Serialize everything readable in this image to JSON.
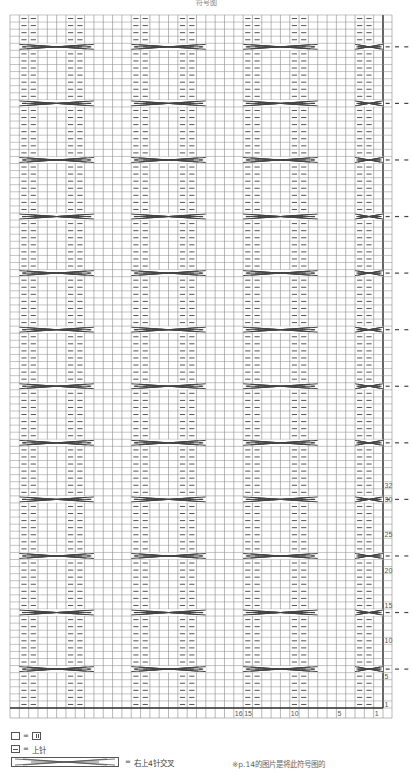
{
  "title": "符号图",
  "chart": {
    "columns": 40,
    "rows": 98,
    "repeat_pattern": [
      "k",
      "p",
      "p",
      "k",
      "k",
      "k",
      "p",
      "p",
      "k",
      "k",
      "k",
      "k"
    ],
    "cable_rows_from_top": [
      4,
      12,
      20,
      28,
      36,
      44,
      52,
      60,
      68,
      76,
      84,
      92
    ],
    "cable_repeat_start_cols": [
      1,
      13,
      25,
      37
    ],
    "row_numbers": [
      {
        "label": "32",
        "row_from_bottom": 32
      },
      {
        "label": "30",
        "row_from_bottom": 30
      },
      {
        "label": "25",
        "row_from_bottom": 25
      },
      {
        "label": "20",
        "row_from_bottom": 20
      },
      {
        "label": "15",
        "row_from_bottom": 15
      },
      {
        "label": "10",
        "row_from_bottom": 10
      },
      {
        "label": "5",
        "row_from_bottom": 5
      },
      {
        "label": "1",
        "row_from_bottom": 1
      }
    ],
    "column_numbers": [
      {
        "label": "16",
        "col_from_right": 16
      },
      {
        "label": "15",
        "col_from_right": 15
      },
      {
        "label": "10",
        "col_from_right": 10
      },
      {
        "label": "5",
        "col_from_right": 5
      },
      {
        "label": "1",
        "col_from_right": 1
      }
    ],
    "colors": {
      "grid": "#8a8a8a",
      "heavy": "#333333",
      "symbol": "#555555",
      "cable": "#444444"
    }
  },
  "legend": {
    "blank_eq": "=",
    "knit_label": "",
    "purl_eq": "=",
    "purl_label": "上针",
    "cable_eq": "=",
    "cable_label": "右上4针交叉",
    "note": "※p.14的图片是将此符号图的"
  }
}
